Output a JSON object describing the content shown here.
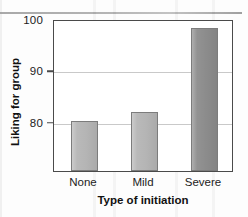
{
  "chart_data": {
    "type": "bar",
    "title": "",
    "subtitle": "",
    "categories": [
      "None",
      "Mild",
      "Severe"
    ],
    "values": [
      80.2,
      81.8,
      98.3
    ],
    "series": [
      {
        "name": "Liking for group",
        "values": [
          80.2,
          81.8,
          98.3
        ]
      }
    ],
    "xlabel": "Type of initiation",
    "ylabel": "Liking for group",
    "ylim": [
      70.4,
      100
    ],
    "yticks": [
      80,
      90,
      100
    ],
    "ytick_labels": [
      "80",
      "90",
      "100"
    ],
    "grid": "horizontal",
    "legend": "none",
    "bar_colors": [
      "#b5b5b5",
      "#b5b5b5",
      "#8c8c8c"
    ],
    "bar_border_color": "#7c7c7c",
    "axis_color": "#4a4a4a",
    "gridline_color": "#c9c9c9",
    "annotations": []
  },
  "axes": {
    "y": {
      "title": "Liking for group",
      "ticks": [
        {
          "label": "100",
          "value": 100
        },
        {
          "label": "90",
          "value": 90
        },
        {
          "label": "80",
          "value": 80
        }
      ]
    },
    "x": {
      "title": "Type of initiation",
      "ticks": [
        {
          "label": "None"
        },
        {
          "label": "Mild"
        },
        {
          "label": "Severe"
        }
      ]
    }
  }
}
